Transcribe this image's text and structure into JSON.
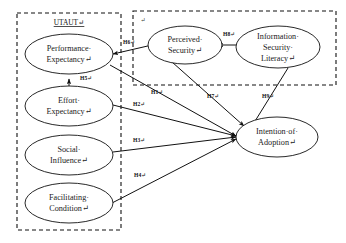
{
  "diagram": {
    "groups": [
      {
        "id": "utaut",
        "label": "UTAUT↵"
      },
      {
        "id": "security",
        "label": "↵"
      }
    ],
    "nodes": [
      {
        "id": "performance-expectancy",
        "line1": "Performance·",
        "line2": "Expectancy↵",
        "line3": ""
      },
      {
        "id": "effort-expectancy",
        "line1": "Effort·",
        "line2": "Expectancy↵",
        "line3": ""
      },
      {
        "id": "social-influence",
        "line1": "Social·",
        "line2": "Influence↵",
        "line3": ""
      },
      {
        "id": "facilitating-condition",
        "line1": "Facilitating·",
        "line2": "Condition↵",
        "line3": ""
      },
      {
        "id": "perceived-security",
        "line1": "Perceived·",
        "line2": "Security↵",
        "line3": ""
      },
      {
        "id": "information-security-literacy",
        "line1": "Information·",
        "line2": "Security·",
        "line3": "Literacy↵"
      },
      {
        "id": "intention-of-adoption",
        "line1": "Intention·of·",
        "line2": "Adoption↵",
        "line3": ""
      }
    ],
    "hypotheses": [
      {
        "id": "h1",
        "label": "H1↵",
        "from": "performance-expectancy",
        "to": "intention-of-adoption"
      },
      {
        "id": "h2",
        "label": "H2↵",
        "from": "effort-expectancy",
        "to": "intention-of-adoption"
      },
      {
        "id": "h3",
        "label": "H3↵",
        "from": "social-influence",
        "to": "intention-of-adoption"
      },
      {
        "id": "h4",
        "label": "H4↵",
        "from": "facilitating-condition",
        "to": "intention-of-adoption"
      },
      {
        "id": "h5",
        "label": "H5↵",
        "from": "effort-expectancy",
        "to": "performance-expectancy"
      },
      {
        "id": "h6",
        "label": "H6↵",
        "from": "perceived-security",
        "to": "performance-expectancy"
      },
      {
        "id": "h7",
        "label": "H7↵",
        "from": "perceived-security",
        "to": "intention-of-adoption"
      },
      {
        "id": "h8",
        "label": "H8↵",
        "from": "information-security-literacy",
        "to": "perceived-security"
      },
      {
        "id": "h9",
        "label": "H9↵",
        "from": "information-security-literacy",
        "to": "intention-of-adoption"
      }
    ],
    "colors": {
      "stroke": "#111111",
      "background": "#ffffff",
      "text": "#1a1a1a"
    }
  }
}
